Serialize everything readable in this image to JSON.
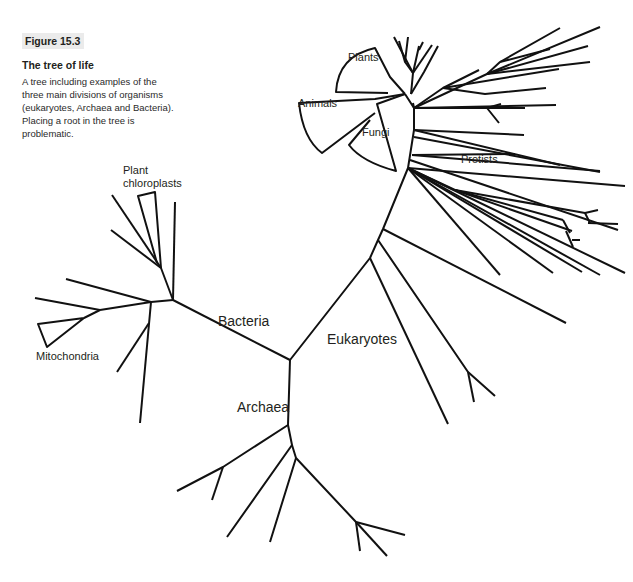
{
  "figure": {
    "label": "Figure 15.3",
    "title": "The tree of life",
    "description": "A tree including examples of the three main divisions of organisms (eukaryotes, Archaea and Bacteria). Placing a root in the tree is problematic.",
    "description_lines": [
      "A tree including examples of the",
      "three main divisions of organisms",
      "(eukaryotes, Archaea and Bacteria).",
      "Placing a root in the tree is",
      "problematic."
    ]
  },
  "tree": {
    "type": "unrooted phylogenetic tree",
    "line_color": "#111111",
    "domains": {
      "bacteria": "Bacteria",
      "eukaryotes": "Eukaryotes",
      "archaea": "Archaea"
    },
    "groups": {
      "plants": "Plants",
      "animals": "Animals",
      "fungi": "Fungi",
      "protists": "Protists",
      "chloroplasts_line1": "Plant",
      "chloroplasts_line2": "chloroplasts",
      "mitochondria": "Mitochondria"
    }
  }
}
